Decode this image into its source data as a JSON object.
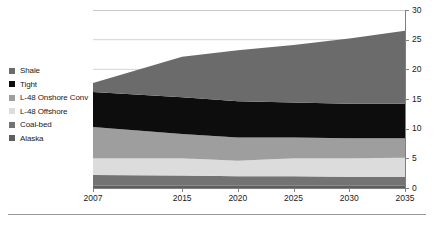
{
  "chart_data": {
    "type": "area",
    "title": "",
    "subtitle": "",
    "xlabel": "",
    "ylabel": "",
    "stacked": true,
    "grid": true,
    "legend_position": "left",
    "x": [
      2007,
      2015,
      2020,
      2025,
      2030,
      2035
    ],
    "tick_labels_x": [
      "2007",
      "2015",
      "2020",
      "2025",
      "2030",
      "2035"
    ],
    "tick_labels_y": [
      "0",
      "5",
      "10",
      "15",
      "20",
      "25",
      "30"
    ],
    "xlim": [
      2007,
      2035
    ],
    "ylim": [
      0,
      30
    ],
    "yticks": [
      0,
      5,
      10,
      15,
      20,
      25,
      30
    ],
    "stack_order_bottom_to_top": [
      "Alaska",
      "Coal-bed",
      "L-48 Offshore",
      "L-48 Onshore Conv",
      "Tight",
      "Shale"
    ],
    "series": [
      {
        "name": "Shale",
        "color": "#6b6b6b",
        "values": [
          1.5,
          6.8,
          8.6,
          9.7,
          11.0,
          12.3
        ]
      },
      {
        "name": "Tight",
        "color": "#0d0d0d",
        "values": [
          5.9,
          6.2,
          6.1,
          5.9,
          5.8,
          5.8
        ]
      },
      {
        "name": "L-48 Onshore Conv",
        "color": "#9e9e9e",
        "values": [
          5.3,
          4.1,
          3.9,
          3.5,
          3.4,
          3.3
        ]
      },
      {
        "name": "L-48 Offshore",
        "color": "#dcdcdc",
        "values": [
          2.8,
          2.9,
          2.6,
          3.0,
          3.1,
          3.2
        ]
      },
      {
        "name": "Coal-bed",
        "color": "#737373",
        "values": [
          1.8,
          1.7,
          1.6,
          1.6,
          1.5,
          1.5
        ]
      },
      {
        "name": "Alaska",
        "color": "#5e5e5e",
        "values": [
          0.4,
          0.4,
          0.4,
          0.4,
          0.4,
          0.4
        ]
      }
    ],
    "totals": [
      19.5,
      22.1,
      23.2,
      24.1,
      25.2,
      26.3
    ]
  },
  "legend": {
    "items": [
      {
        "label": "Shale",
        "color": "#6b6b6b"
      },
      {
        "label": "Tight",
        "color": "#0d0d0d"
      },
      {
        "label": "L-48 Onshore Conv",
        "color": "#9e9e9e"
      },
      {
        "label": "L-48 Offshore",
        "color": "#dcdcdc"
      },
      {
        "label": "Coal-bed",
        "color": "#737373"
      },
      {
        "label": "Alaska",
        "color": "#5e5e5e"
      }
    ]
  },
  "axes": {
    "y_ticks": [
      "30",
      "25",
      "20",
      "15",
      "10",
      "5",
      "0"
    ],
    "x_ticks": [
      "2007",
      "2015",
      "2020",
      "2025",
      "2030",
      "2035"
    ]
  },
  "caption": {
    "text": ""
  }
}
